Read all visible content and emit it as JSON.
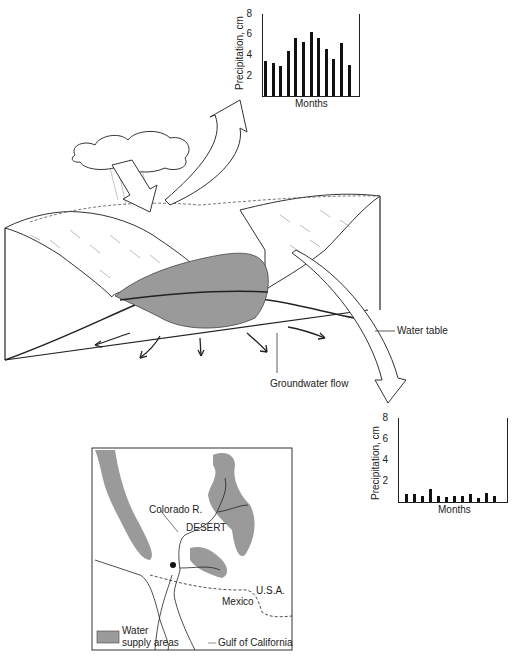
{
  "labels": {
    "water_table": "Water table",
    "groundwater_flow": "Groundwater flow"
  },
  "map": {
    "colorado_river": "Colorado R.",
    "desert": "DESERT",
    "usa": "U.S.A.",
    "mexico": "Mexico",
    "gulf": "Gulf of California",
    "legend_line1": "Water",
    "legend_line2": "supply areas"
  },
  "chart_data": [
    {
      "type": "bar",
      "title": "",
      "xlabel": "Months",
      "ylabel": "Precipitation, cm",
      "ylim": [
        0,
        8
      ],
      "yticks": [
        "2",
        "4",
        "6",
        "8"
      ],
      "categories": [
        "1",
        "2",
        "3",
        "4",
        "5",
        "6",
        "7",
        "8",
        "9",
        "10",
        "11",
        "12"
      ],
      "values": [
        3.4,
        3.2,
        2.9,
        4.4,
        5.7,
        5.3,
        6.2,
        5.7,
        4.6,
        3.6,
        5.2,
        3.0
      ],
      "position": "mountain (windward) slope"
    },
    {
      "type": "bar",
      "title": "",
      "xlabel": "Months",
      "ylabel": "Precipitation, cm",
      "ylim": [
        0,
        8
      ],
      "yticks": [
        "2",
        "4",
        "6",
        "8"
      ],
      "categories": [
        "1",
        "2",
        "3",
        "4",
        "5",
        "6",
        "7",
        "8",
        "9",
        "10",
        "11",
        "12"
      ],
      "values": [
        0.8,
        0.8,
        0.6,
        1.2,
        0.6,
        0.5,
        0.6,
        0.6,
        0.8,
        0.4,
        0.9,
        0.6
      ],
      "position": "desert (lee) slope"
    }
  ]
}
